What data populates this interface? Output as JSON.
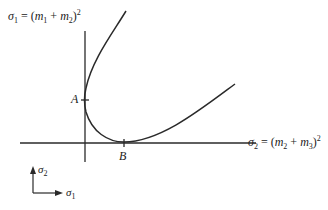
{
  "diagram": {
    "y_axis_label": {
      "sigma": "σ",
      "sub": "1",
      "eq": " = (",
      "m1": "m",
      "m1_sub": "1",
      "plus": " + ",
      "m2": "m",
      "m2_sub": "2",
      "close": ")",
      "exp": "2"
    },
    "x_axis_label": {
      "sigma": "σ",
      "sub": "2",
      "eq": " = (",
      "m1": "m",
      "m1_sub": "2",
      "plus": " + ",
      "m2": "m",
      "m2_sub": "3",
      "close": ")",
      "exp": "2"
    },
    "points": {
      "A": "A",
      "B": "B"
    },
    "legend": {
      "up": {
        "sigma": "σ",
        "sub": "2"
      },
      "right": {
        "sigma": "σ",
        "sub": "1"
      }
    },
    "colors": {
      "ink": "#2a2a2a",
      "background": "#ffffff"
    }
  }
}
